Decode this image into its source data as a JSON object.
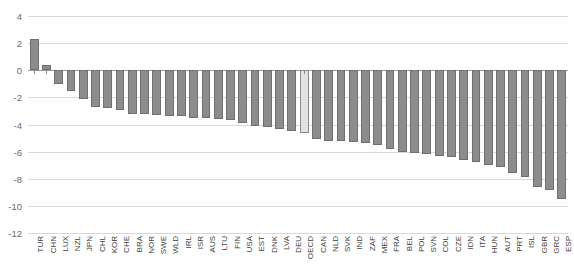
{
  "chart_data": {
    "type": "bar",
    "title": "",
    "subtitle": "",
    "xlabel": "",
    "ylabel": "",
    "ylim": [
      -12,
      4
    ],
    "yticks": [
      4,
      2,
      0,
      -2,
      -4,
      -6,
      -8,
      -10,
      -12
    ],
    "ytick_labels": [
      "4",
      "2",
      "0",
      "-2",
      "-4",
      "-6",
      "-8",
      "-10",
      "-12"
    ],
    "grid": true,
    "legend": "none",
    "gridline_color": "#d9d9d9",
    "bar_color": "#8c8c8c",
    "bar_border_color": "#6f6f6f",
    "highlight_color": "#e2e2e2",
    "highlight_category": "OECD",
    "categories": [
      "TUR",
      "CHN",
      "LUX",
      "NZL",
      "JPN",
      "CHL",
      "KOR",
      "CHE",
      "BRA",
      "NOR",
      "SWE",
      "WLD",
      "IRL",
      "ISR",
      "AUS",
      "LTU",
      "FIN",
      "USA",
      "EST",
      "DNK",
      "LVA",
      "DEU",
      "OECD",
      "CAN",
      "NLD",
      "SVK",
      "IND",
      "ZAF",
      "MEX",
      "FRA",
      "BEL",
      "POL",
      "SVN",
      "COL",
      "CZE",
      "IDN",
      "ITA",
      "HUN",
      "AUT",
      "PRT",
      "ISL",
      "GBR",
      "GRC",
      "ESP"
    ],
    "values": [
      2.3,
      0.4,
      -1.0,
      -1.5,
      -2.1,
      -2.7,
      -2.8,
      -2.9,
      -3.2,
      -3.2,
      -3.3,
      -3.4,
      -3.4,
      -3.5,
      -3.5,
      -3.6,
      -3.7,
      -3.9,
      -4.1,
      -4.2,
      -4.3,
      -4.5,
      -4.6,
      -5.1,
      -5.2,
      -5.2,
      -5.3,
      -5.4,
      -5.5,
      -5.8,
      -6.0,
      -6.1,
      -6.2,
      -6.3,
      -6.4,
      -6.6,
      -6.8,
      -7.0,
      -7.1,
      -7.6,
      -7.9,
      -8.6,
      -8.8,
      -9.5
    ]
  }
}
